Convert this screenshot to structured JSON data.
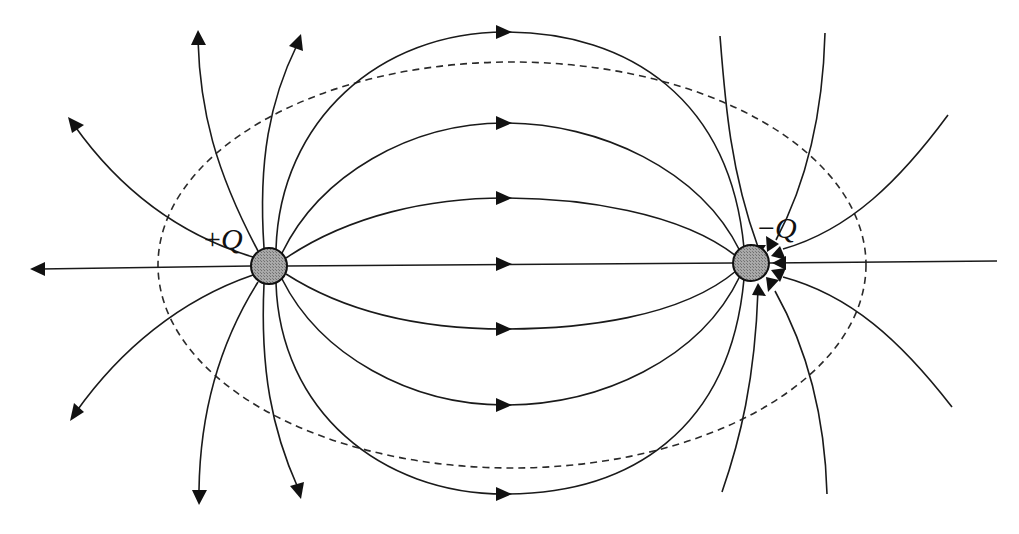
{
  "figure": {
    "charges": [
      {
        "id": "positive",
        "label_sign": "+",
        "label_symbol": "Q",
        "cx": 269,
        "cy": 266,
        "r": 18
      },
      {
        "id": "negative",
        "label_sign": "−",
        "label_symbol": "Q",
        "cx": 751,
        "cy": 263,
        "r": 18
      }
    ],
    "gaussian_surface": {
      "shape": "ellipse",
      "style": "dashed",
      "cx": 512,
      "cy": 265,
      "rx": 354,
      "ry": 203
    },
    "colors": {
      "line": "#1a1a1a",
      "charge_fill": "#9a9a9a",
      "background": "#ffffff"
    },
    "field_line_direction": "from +Q to −Q",
    "connecting_lines_count": 7,
    "outward_lines_from_positive": 7,
    "inward_lines_to_negative": 7
  }
}
